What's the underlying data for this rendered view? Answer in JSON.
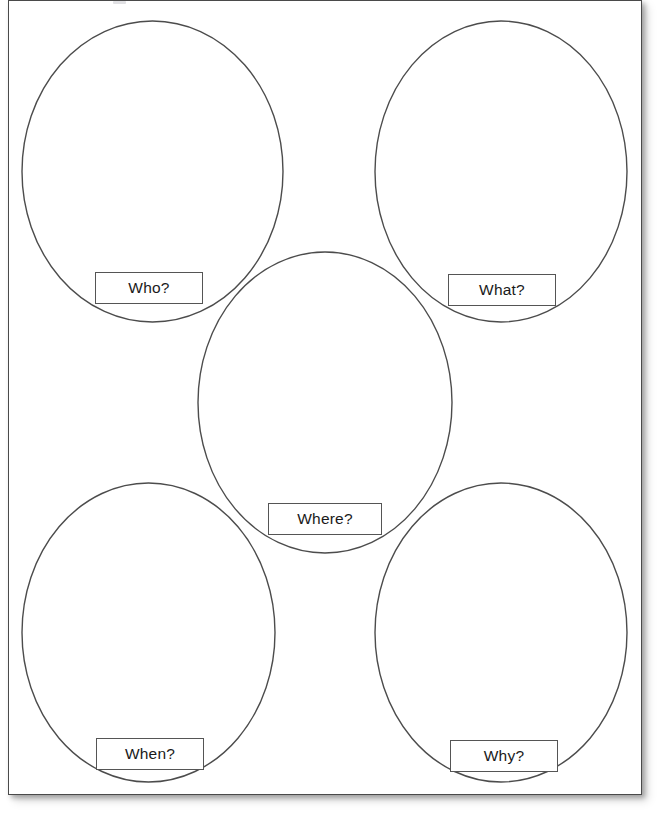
{
  "page": {
    "type": "graphic-organizer-worksheet",
    "background_color": "#ffffff",
    "sheet_border_color": "#4a4a4a",
    "outline_color": "#4c4c4c",
    "text_color": "#1a1a1a",
    "label_border_color": "#555555",
    "width": 657,
    "height": 816
  },
  "organizer": {
    "shape_kind": "ellipse",
    "shape_count": 5,
    "shapes": [
      {
        "id": "who",
        "label": "Who?",
        "position": "top-left",
        "cx": 152.5,
        "cy": 171.5,
        "rx": 130.5,
        "ry": 150.5,
        "label_box": {
          "x": 95,
          "y": 272,
          "w": 108,
          "h": 32
        }
      },
      {
        "id": "what",
        "label": "What?",
        "position": "top-right",
        "cx": 501.0,
        "cy": 171.5,
        "rx": 126.0,
        "ry": 150.5,
        "label_box": {
          "x": 448,
          "y": 274,
          "w": 108,
          "h": 32
        }
      },
      {
        "id": "where",
        "label": "Where?",
        "position": "center",
        "cx": 325.0,
        "cy": 402.5,
        "rx": 127.0,
        "ry": 150.5,
        "label_box": {
          "x": 268,
          "y": 503,
          "w": 114,
          "h": 32
        }
      },
      {
        "id": "when",
        "label": "When?",
        "position": "bottom-left",
        "cx": 148.5,
        "cy": 632.5,
        "rx": 126.5,
        "ry": 149.5,
        "label_box": {
          "x": 96,
          "y": 738,
          "w": 108,
          "h": 32
        }
      },
      {
        "id": "why",
        "label": "Why?",
        "position": "bottom-right",
        "cx": 501.0,
        "cy": 632.5,
        "rx": 126.0,
        "ry": 149.5,
        "label_box": {
          "x": 450,
          "y": 740,
          "w": 108,
          "h": 32
        }
      }
    ]
  }
}
